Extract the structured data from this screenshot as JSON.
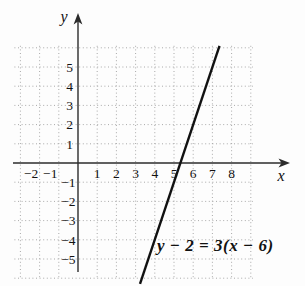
{
  "chart_data": {
    "type": "line",
    "title": "",
    "equation": "y − 2 = 3(x − 6)",
    "xlabel": "x",
    "ylabel": "y",
    "xlim": [
      -3.3,
      9.8
    ],
    "ylim": [
      -6.4,
      7.4
    ],
    "x_tick_labels": [
      -2,
      -1,
      1,
      2,
      3,
      4,
      5,
      6,
      7,
      8
    ],
    "y_tick_labels": [
      5,
      4,
      3,
      2,
      1,
      -1,
      -2,
      -3,
      -4,
      -5
    ],
    "grid": "dotted",
    "grid_x_range": [
      -3,
      9
    ],
    "grid_y_range": [
      -6,
      6
    ],
    "line": {
      "slope": 3,
      "y_intercept": -16,
      "x_intercept": 5.333,
      "passes_through_point": [
        6,
        2
      ],
      "segment_units": [
        [
          3.23,
          -6.3
        ],
        [
          7.37,
          6.1
        ]
      ]
    },
    "legend": "none",
    "colors": {
      "line": "#111111",
      "axis": "#2b2b2b",
      "grid": "#a9a9a9",
      "text": "#111111",
      "background": "#fdfdfd"
    }
  }
}
